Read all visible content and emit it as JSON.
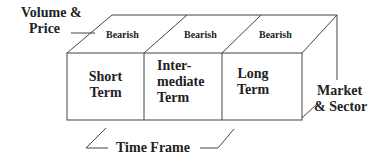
{
  "axes": {
    "top_axis_label_line1": "Volume &",
    "top_axis_label_line2": "Price",
    "right_axis_label_line1": "Market",
    "right_axis_label_line2": "& Sector",
    "bottom_axis_label": "Time Frame"
  },
  "top_face": [
    {
      "label": "Bearish"
    },
    {
      "label": "Bearish"
    },
    {
      "label": "Bearish"
    }
  ],
  "front_face": [
    {
      "line1": "Short",
      "line2": "Term",
      "line3": ""
    },
    {
      "line1": "Inter-",
      "line2": "mediate",
      "line3": "Term"
    },
    {
      "line1": "Long",
      "line2": "Term",
      "line3": ""
    }
  ],
  "colors": {
    "line": "#444444",
    "text": "#222222",
    "background": "#ffffff"
  }
}
